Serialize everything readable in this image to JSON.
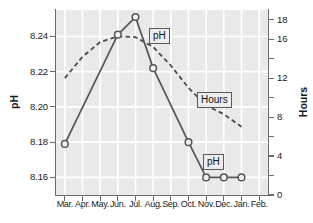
{
  "chart_data": {
    "type": "line",
    "title": "",
    "xlabel": "",
    "ylabel": "pH",
    "y2label": "Hours",
    "categories": [
      "Mar.",
      "Apr.",
      "May.",
      "Jun.",
      "Jul.",
      "Aug.",
      "Sep.",
      "Oct.",
      "Nov.",
      "Dec.",
      "Jan.",
      "Feb."
    ],
    "ylim": [
      8.15,
      8.255
    ],
    "y2lim": [
      0,
      19
    ],
    "yticks": [
      "8.16",
      "8.18",
      "8.20",
      "8.22",
      "8.24"
    ],
    "ytick_values": [
      8.16,
      8.18,
      8.2,
      8.22,
      8.24
    ],
    "y2ticks": [
      "0",
      "4",
      "8",
      "12",
      "16",
      "18"
    ],
    "y2tick_values": [
      0,
      4,
      8,
      12,
      16,
      18
    ],
    "grid": true,
    "legend_position": "inline-annotations",
    "series": [
      {
        "name": "pH",
        "axis": "left",
        "style": "solid",
        "marker": "open-circle",
        "color": "#555555",
        "x": [
          "Mar.",
          "Apr.",
          "May.",
          "Jun.",
          "Jul.",
          "Aug.",
          "Sep.",
          "Oct.",
          "Nov.",
          "Dec.",
          "Jan.",
          "Feb."
        ],
        "values": [
          8.179,
          null,
          null,
          8.241,
          8.251,
          8.222,
          null,
          8.18,
          8.16,
          8.16,
          8.16,
          null
        ]
      },
      {
        "name": "Hours",
        "axis": "right",
        "style": "dashed",
        "marker": "none",
        "color": "#4a4a4a",
        "x": [
          "Mar.",
          "Apr.",
          "May.",
          "Jun.",
          "Jul.",
          "Aug.",
          "Sep.",
          "Oct.",
          "Nov.",
          "Dec.",
          "Jan.",
          "Feb."
        ],
        "values": [
          12.0,
          14.2,
          15.7,
          16.3,
          16.2,
          15.2,
          13.3,
          11.0,
          9.2,
          8.3,
          7.0,
          null
        ]
      }
    ],
    "annotations": [
      {
        "text": "pH",
        "series": "pH",
        "position": "upper-middle"
      },
      {
        "text": "Hours",
        "series": "Hours",
        "position": "middle-right"
      },
      {
        "text": "pH",
        "series": "pH",
        "position": "lower-right"
      }
    ]
  }
}
